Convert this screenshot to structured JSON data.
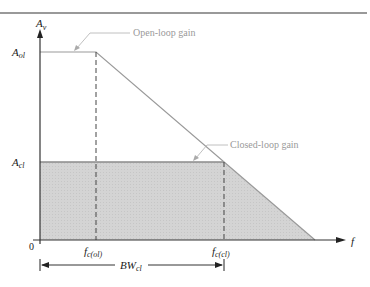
{
  "diagram": {
    "title_rule": true,
    "y_axis": {
      "label": "A",
      "label_sub": "v"
    },
    "x_axis": {
      "label": "f",
      "origin": "0"
    },
    "levels": {
      "open_loop": {
        "label": "A",
        "label_sub": "ol"
      },
      "closed_loop": {
        "label": "A",
        "label_sub": "cl"
      }
    },
    "cutoffs": {
      "open_loop": {
        "label": "f",
        "label_sub": "c(ol)"
      },
      "closed_loop": {
        "label": "f",
        "label_sub": "c(cl)"
      }
    },
    "annotations": {
      "open_loop_gain": "Open-loop gain",
      "closed_loop_gain": "Closed-loop gain"
    },
    "bandwidth": {
      "label": "BW",
      "label_sub": "cl"
    },
    "colors": {
      "shade": "#d6d6d6",
      "line": "#8a8a8a",
      "axis": "#333333",
      "rule": "#777777",
      "caption": "#9a9a9a"
    }
  }
}
